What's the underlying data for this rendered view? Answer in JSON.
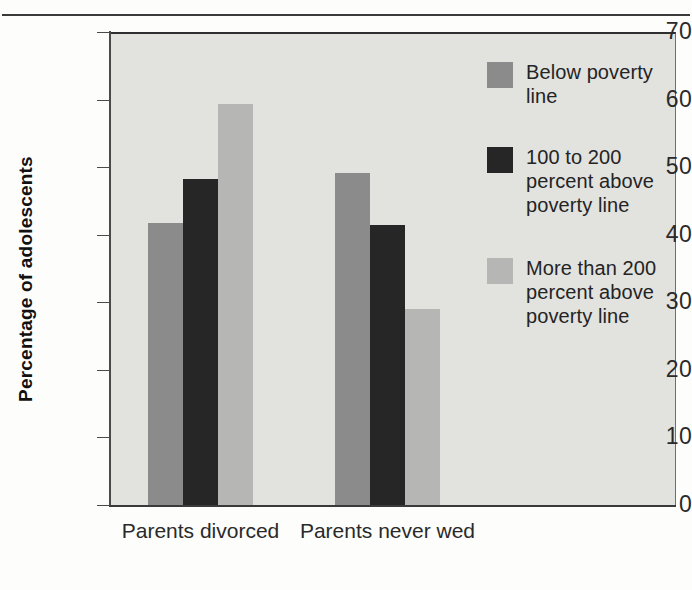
{
  "chart_data": {
    "type": "bar",
    "title": "",
    "xlabel": "",
    "ylabel": "Percentage of adolescents",
    "ylim": [
      0,
      70
    ],
    "ytick_labels": [
      "70",
      "60",
      "50",
      "40",
      "30",
      "20",
      "10",
      "0"
    ],
    "ytick_values": [
      70,
      60,
      50,
      40,
      30,
      20,
      10,
      0
    ],
    "grid": false,
    "legend_position": "inside-top-right",
    "categories": [
      "Parents divorced",
      "Parents never wed"
    ],
    "category_lines": [
      [
        "Parents",
        "divorced"
      ],
      [
        "Parents",
        "never wed"
      ]
    ],
    "series": [
      {
        "name": "Below poverty line",
        "label_lines": [
          "Below poverty",
          "line"
        ],
        "color": "#8b8b8b",
        "values": [
          42.0,
          49.5
        ]
      },
      {
        "name": "100 to 200 percent above poverty line",
        "label_lines": [
          "100 to 200",
          "percent above",
          "poverty line"
        ],
        "color": "#262626",
        "values": [
          48.5,
          41.7
        ]
      },
      {
        "name": "More than 200 percent above poverty line",
        "label_lines": [
          "More than 200",
          "percent above",
          "poverty line"
        ],
        "color": "#b6b6b4",
        "values": [
          59.6,
          29.3
        ]
      }
    ]
  },
  "figure": {
    "plot_background": "#e2e2df",
    "axis_color": "#3a3a3a",
    "text_color": "#2a2a2a"
  },
  "axis": {
    "y_title": "Percentage of adolescents"
  },
  "legend": {
    "items": [
      {
        "label": "Below poverty\nline",
        "color": "#8b8b8b"
      },
      {
        "label": "100 to 200\npercent above\npoverty line",
        "color": "#262626"
      },
      {
        "label": "More than 200\npercent above\npoverty line",
        "color": "#b6b6b4"
      }
    ]
  },
  "xaxis": {
    "groups": [
      {
        "label": "Parents\ndivorced"
      },
      {
        "label": "Parents\nnever wed"
      }
    ]
  },
  "yaxis": {
    "ticks": [
      {
        "label": "70",
        "value": 70
      },
      {
        "label": "60",
        "value": 60
      },
      {
        "label": "50",
        "value": 50
      },
      {
        "label": "40",
        "value": 40
      },
      {
        "label": "30",
        "value": 30
      },
      {
        "label": "20",
        "value": 20
      },
      {
        "label": "10",
        "value": 10
      },
      {
        "label": "0",
        "value": 0
      }
    ]
  }
}
